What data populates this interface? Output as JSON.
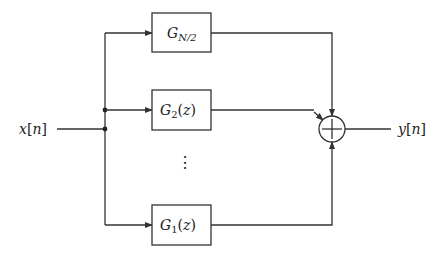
{
  "diagram": {
    "type": "block-diagram",
    "input": {
      "symbol": "x",
      "index": "n"
    },
    "output": {
      "symbol": "y",
      "index": "n"
    },
    "summer": {
      "symbol": "+"
    },
    "ellipsis": "⋮",
    "blocks": [
      {
        "id": "g-n2",
        "symbol": "G",
        "subscript": "N/2",
        "arg": ""
      },
      {
        "id": "g-2",
        "symbol": "G",
        "subscript": "2",
        "arg": "z"
      },
      {
        "id": "g-1",
        "symbol": "G",
        "subscript": "1",
        "arg": "z"
      }
    ],
    "colors": {
      "line": "#333333",
      "background": "#ffffff"
    }
  }
}
